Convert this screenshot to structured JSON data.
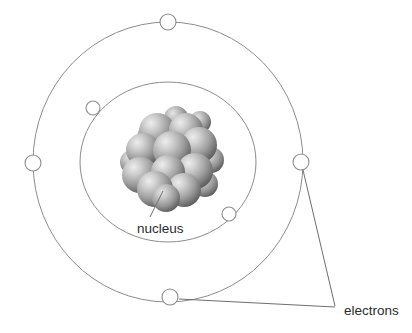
{
  "figure": {
    "background_color": "#ffffff",
    "width": 412,
    "height": 333
  },
  "labels": {
    "nucleus": "nucleus",
    "electrons": "electrons"
  },
  "colors": {
    "orbit_stroke": "#8c8c8c",
    "electron_fill": "#ffffff",
    "electron_stroke": "#8c8c8c",
    "leader_stroke": "#6e6e6e",
    "text": "#2b2b2b",
    "nucleon_light": "#d8d8d8",
    "nucleon_mid": "#9a9a9a",
    "nucleon_dark": "#555555"
  },
  "diagram": {
    "type": "bohr-atom-model",
    "center": {
      "x": 168,
      "y": 162
    },
    "shells": [
      {
        "name": "inner-shell",
        "rx": 88,
        "ry": 80,
        "electron_count": 2,
        "electron_radius": 7
      },
      {
        "name": "outer-shell",
        "rx": 135,
        "ry": 140,
        "electron_count": 4,
        "electron_radius": 8
      }
    ],
    "electrons": [
      {
        "id": "electron-outer-top",
        "shell": "outer-shell",
        "x": 168,
        "y": 22,
        "r": 8
      },
      {
        "id": "electron-outer-left",
        "shell": "outer-shell",
        "x": 33,
        "y": 163,
        "r": 8
      },
      {
        "id": "electron-outer-right",
        "shell": "outer-shell",
        "x": 301,
        "y": 162,
        "r": 8
      },
      {
        "id": "electron-outer-bottom",
        "shell": "outer-shell",
        "x": 170,
        "y": 297,
        "r": 8
      },
      {
        "id": "electron-inner-upper-left",
        "shell": "inner-shell",
        "x": 93,
        "y": 108,
        "r": 7
      },
      {
        "id": "electron-inner-lower-right",
        "shell": "inner-shell",
        "x": 229,
        "y": 214,
        "r": 7
      }
    ],
    "nucleus": {
      "center": {
        "x": 170,
        "y": 160
      },
      "nucleon_count": 17,
      "nucleons": [
        {
          "cx": 157,
          "cy": 131,
          "r": 18
        },
        {
          "cx": 186,
          "cy": 130,
          "r": 17
        },
        {
          "cx": 143,
          "cy": 150,
          "r": 17
        },
        {
          "cx": 172,
          "cy": 150,
          "r": 19
        },
        {
          "cx": 199,
          "cy": 145,
          "r": 18
        },
        {
          "cx": 140,
          "cy": 175,
          "r": 18
        },
        {
          "cx": 168,
          "cy": 172,
          "r": 17
        },
        {
          "cx": 195,
          "cy": 171,
          "r": 18
        },
        {
          "cx": 211,
          "cy": 160,
          "r": 13
        },
        {
          "cx": 155,
          "cy": 189,
          "r": 18
        },
        {
          "cx": 184,
          "cy": 190,
          "r": 17
        },
        {
          "cx": 166,
          "cy": 198,
          "r": 14
        },
        {
          "cx": 205,
          "cy": 184,
          "r": 13
        },
        {
          "cx": 150,
          "cy": 137,
          "r": 13
        },
        {
          "cx": 176,
          "cy": 118,
          "r": 12
        },
        {
          "cx": 200,
          "cy": 122,
          "r": 11
        },
        {
          "cx": 132,
          "cy": 162,
          "r": 12
        }
      ]
    },
    "leaders": {
      "nucleus": {
        "from_x": 163,
        "from_y": 191,
        "to_x": 150,
        "to_y": 217
      },
      "electrons_right": {
        "from_x": 303,
        "from_y": 170,
        "to_x": 335,
        "to_y": 306
      },
      "electrons_bottom": {
        "from_x": 179,
        "from_y": 299,
        "to_x": 335,
        "to_y": 307
      }
    },
    "label_positions": {
      "nucleus": {
        "x": 137,
        "y": 233
      },
      "electrons": {
        "x": 344,
        "y": 315
      }
    }
  }
}
